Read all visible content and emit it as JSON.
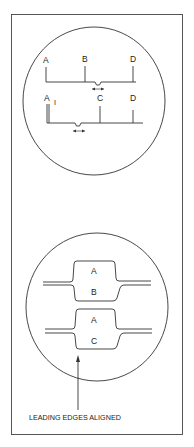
{
  "figure": {
    "type": "oscilloscope-timing-diagram",
    "upper_scope": {
      "trace_1": {
        "labels": [
          "A",
          "B",
          "D"
        ]
      },
      "trace_2": {
        "labels": [
          "A",
          "I",
          "C",
          "D"
        ]
      }
    },
    "lower_scope": {
      "pulse_1": {
        "top_label": "A",
        "bottom_label": "B"
      },
      "pulse_2": {
        "top_label": "A",
        "bottom_label": "C"
      }
    },
    "caption": "LEADING EDGES ALIGNED",
    "colors": {
      "line": "#333333",
      "background": "#ffffff"
    }
  }
}
